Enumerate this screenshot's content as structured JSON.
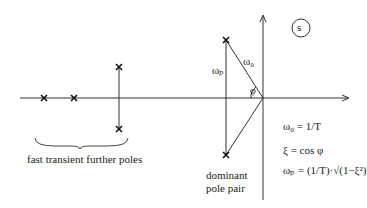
{
  "diagram": {
    "plane_label": "s",
    "omega0_label": "ω₀",
    "omegap_label": "ωₚ",
    "phi_label": "φ",
    "further_poles_label": "fast transient further poles",
    "dominant_label_line1": "dominant",
    "dominant_label_line2": "pole pair",
    "equations": {
      "eq1": "ω₀ = 1/T",
      "eq2": "ξ = cos φ",
      "eq3": "ωₚ = (1/T)·√(1−ξ²)"
    },
    "poles": [
      {
        "name": "real-pole-1",
        "x": 44,
        "y": 98
      },
      {
        "name": "real-pole-2",
        "x": 74,
        "y": 98
      },
      {
        "name": "further-pole-upper",
        "x": 119,
        "y": 67
      },
      {
        "name": "further-pole-lower",
        "x": 119,
        "y": 129
      },
      {
        "name": "dominant-pole-upper",
        "x": 226,
        "y": 40
      },
      {
        "name": "dominant-pole-lower",
        "x": 226,
        "y": 155
      }
    ]
  }
}
